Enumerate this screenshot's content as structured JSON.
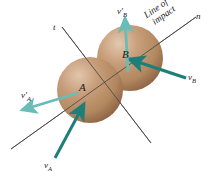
{
  "figure": {
    "background": "#ffffff",
    "axes": {
      "normal_label": "n",
      "tangent_label": "t",
      "line_color": "#555555"
    },
    "annotation": {
      "line1": "Line of",
      "line2": "impact"
    },
    "spheres": [
      {
        "id": "A",
        "label": "A",
        "cx": 90,
        "cy": 90,
        "r": 33,
        "fill": "#b98f६d"
      },
      {
        "id": "B",
        "label": "B",
        "cx": 130,
        "cy": 58,
        "r": 33,
        "fill": "#b98f6d"
      }
    ],
    "vectors": [
      {
        "id": "vA",
        "label": "v",
        "sub": "A",
        "prime": false,
        "color": "#1e7f7a",
        "note": "incoming velocity of sphere A"
      },
      {
        "id": "vB",
        "label": "v",
        "sub": "B",
        "prime": false,
        "color": "#1e7f7a",
        "note": "incoming velocity of sphere B"
      },
      {
        "id": "vAp",
        "label": "v",
        "sub": "A",
        "prime": true,
        "color": "#62b5b0",
        "note": "outgoing velocity of sphere A"
      },
      {
        "id": "vBp",
        "label": "v",
        "sub": "B",
        "prime": true,
        "color": "#62b5b0",
        "note": "outgoing velocity of sphere B"
      }
    ],
    "colors": {
      "sphere_light": "#d7b79a",
      "sphere_mid": "#bb9070",
      "sphere_dark": "#8e6245",
      "vector_dark": "#1e7f7a",
      "vector_light": "#68bdb8",
      "axis": "#555555",
      "text": "#1a1a1a"
    }
  }
}
